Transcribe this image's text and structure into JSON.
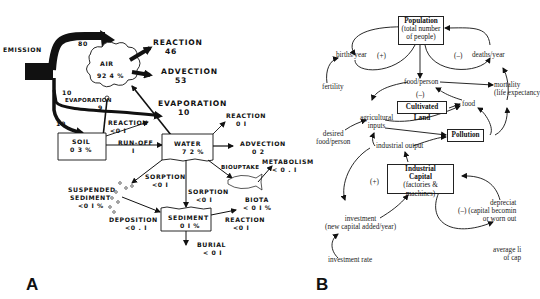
{
  "figure": {
    "panel_a_label": "A",
    "panel_b_label": "B"
  },
  "panel_a": {
    "emission": {
      "label": "EMISSION",
      "to_air": "80",
      "to_soil": "10",
      "to_water": "10"
    },
    "air": {
      "label": "AIR",
      "percent": "92 4 %"
    },
    "air_reaction": {
      "label": "REACTION",
      "value": "46"
    },
    "air_advection": {
      "label": "ADVECTION",
      "value": "53"
    },
    "soil_evaporation": {
      "label": "EVAPORATION",
      "value": "9"
    },
    "water_evaporation": {
      "label": "EVAPORATION",
      "value": "10"
    },
    "soil": {
      "label": "SOIL",
      "percent": "0 3 %"
    },
    "soil_reaction": {
      "label": "REACTION",
      "value": "<0 I"
    },
    "runoff": {
      "label": "RUN-OFF",
      "value": "I"
    },
    "water": {
      "label": "WATER",
      "percent": "7 2 %"
    },
    "water_reaction": {
      "label": "REACTION",
      "value": "0 I"
    },
    "water_advection": {
      "label": "ADVECTION",
      "value": "0 2"
    },
    "biouptake": {
      "label": "BIOUPTAKE"
    },
    "metabolism": {
      "label": "METABOLISM",
      "value": "< 0 . I"
    },
    "biota": {
      "label": "BIOTA",
      "value": "< 0 I %"
    },
    "sorption_suspended": {
      "label": "SORPTION",
      "value": "<0 I"
    },
    "sorption_sediment": {
      "label": "SORPTION",
      "value": "<0 I"
    },
    "suspended_sediment": {
      "label1": "SUSPENDED",
      "label2": "SEDIMENT",
      "value": "<0 I %"
    },
    "deposition": {
      "label": "DEPOSITION",
      "value": "<0 . I"
    },
    "sediment": {
      "label": "SEDIMENT",
      "percent": "0 I %"
    },
    "sediment_reaction": {
      "label": "REACTION",
      "value": "<0 I"
    },
    "burial": {
      "label": "BURIAL",
      "value": "< 0 I"
    }
  },
  "panel_b": {
    "population": {
      "title": "Population",
      "line1": "(total number",
      "line2": "of people)"
    },
    "births": "births/year",
    "deaths": "deaths/year",
    "plus_loop": "(+)",
    "minus_loop": "(–)",
    "fertility": "fertility",
    "food_per_person": "food/person",
    "minus_food": "(–)",
    "mortality": {
      "line1": "mortality",
      "line2": "(life expectancy"
    },
    "cultivated_land": "Cultivated Land",
    "food": "food",
    "agricultural_inputs": {
      "line1": "agricultural",
      "line2": "inputs"
    },
    "desired_food": {
      "line1": "desired",
      "line2": "food/person"
    },
    "pollution": "Pollution",
    "industrial_output": "industrial output",
    "industrial_capital": {
      "line1": "Industrial",
      "line2": "Capital",
      "line3": "(factories & machines)"
    },
    "capital_plus": "(+)",
    "investment": {
      "line1": "investment",
      "line2": "(new capital added/year)"
    },
    "investment_rate": "investment rate",
    "depreciation": {
      "sign": "(–)",
      "line1": "depreciat",
      "line2": "(capital becomin",
      "line3": "or worn out"
    },
    "average_lifetime": {
      "line1": "average li",
      "line2": "of cap"
    }
  }
}
